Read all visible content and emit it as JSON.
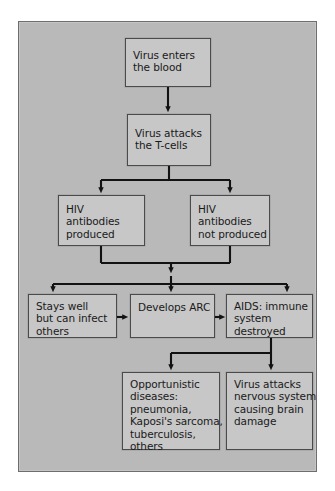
{
  "figure": {
    "panel_background": "#b9b9b9",
    "node_background": "#c7c7c7",
    "node_border": "#4a4a4a",
    "connector_color": "#121212",
    "text_color": "#1a1a1a"
  },
  "nodes": {
    "virus_enters": {
      "id": "virus-enters-the-blood",
      "lines": [
        "Virus enters",
        "the blood"
      ]
    },
    "virus_attacks": {
      "id": "virus-attacks-the-t-cells",
      "lines": [
        "Virus attacks",
        "the T-cells"
      ]
    },
    "antibodies_produced": {
      "id": "hiv-antibodies-produced",
      "lines": [
        "HIV",
        "antibodies",
        "produced"
      ]
    },
    "antibodies_not_produced": {
      "id": "hiv-antibodies-not-produced",
      "lines": [
        "HIV",
        "antibodies",
        "not produced"
      ]
    },
    "stays_well": {
      "id": "stays-well-but-can-infect-others",
      "lines": [
        "Stays well",
        "but can infect",
        "others"
      ]
    },
    "develops_arc": {
      "id": "develops-arc",
      "lines": [
        "Develops ARC"
      ]
    },
    "aids": {
      "id": "aids-immune-system-destroyed",
      "lines": [
        "AIDS: immune",
        "system",
        "destroyed"
      ]
    },
    "opportunistic": {
      "id": "opportunistic-diseases",
      "lines": [
        "Opportunistic",
        "diseases:",
        "pneumonia,",
        "Kaposi's sarcoma,",
        "tuberculosis,",
        "others"
      ]
    },
    "nervous_system": {
      "id": "virus-attacks-nervous-system",
      "lines": [
        "Virus attacks",
        "nervous system",
        "causing brain",
        "damage"
      ]
    }
  },
  "connectors": [
    {
      "name": "enters-to-attacks",
      "from": "virus_enters",
      "to": "virus_attacks",
      "style": "vertical-arrow"
    },
    {
      "name": "attacks-split",
      "from": "virus_attacks",
      "to": [
        "antibodies_produced",
        "antibodies_not_produced"
      ],
      "style": "branch-two"
    },
    {
      "name": "antibodies-merge",
      "from": [
        "antibodies_produced",
        "antibodies_not_produced"
      ],
      "to": "three-way-split",
      "style": "merge"
    },
    {
      "name": "merge-split-three",
      "from": "merge",
      "to": [
        "stays_well",
        "develops_arc",
        "aids"
      ],
      "style": "branch-three"
    },
    {
      "name": "stays-well-to-arc",
      "from": "stays_well",
      "to": "develops_arc",
      "style": "horizontal-arrow"
    },
    {
      "name": "arc-to-aids",
      "from": "develops_arc",
      "to": "aids",
      "style": "horizontal-arrow"
    },
    {
      "name": "aids-split",
      "from": "aids",
      "to": [
        "opportunistic",
        "nervous_system"
      ],
      "style": "branch-two"
    }
  ]
}
